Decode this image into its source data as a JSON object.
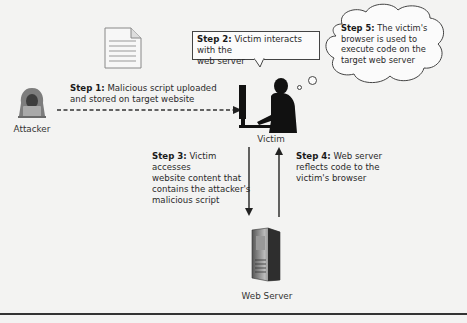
{
  "diagram": {
    "title_hint": "Stored cross-site scripting attack flow",
    "nodes": {
      "attacker": {
        "label": "Attacker",
        "icon": "hooded-hacker-icon"
      },
      "script": {
        "icon": "document-icon"
      },
      "victim": {
        "label": "Victim",
        "icon": "person-at-computer-icon"
      },
      "server": {
        "label": "Web Server",
        "icon": "server-tower-icon"
      }
    },
    "steps": [
      {
        "id": "step1",
        "title": "Step 1:",
        "text": "Malicious script uploaded and stored on target website",
        "line1": "Malicious script uploaded",
        "line2": "and stored on target website"
      },
      {
        "id": "step2",
        "title": "Step 2:",
        "text": "Victim interacts with the web server",
        "line1": "Victim interacts with the",
        "line2": "web server"
      },
      {
        "id": "step3",
        "title": "Step 3:",
        "text": "Victim accesses website content that contains the attacker's malicious script",
        "line1": "Victim accesses",
        "line2": "website content that",
        "line3": "contains the attacker's",
        "line4": "malicious script"
      },
      {
        "id": "step4",
        "title": "Step 4:",
        "text": "Web server reflects code to the victim's browser",
        "line1": "Web server",
        "line2": "reflects code to the",
        "line3": "victim's browser"
      },
      {
        "id": "step5",
        "title": "Step 5:",
        "text": "The victim's browser is used to execute code on the target web server",
        "line1": "The victim's",
        "line2": "browser is used to",
        "line3": "execute code on the",
        "line4": "target web server"
      }
    ],
    "edges": [
      {
        "from": "attacker",
        "to": "victim",
        "style": "dashed",
        "step": "step1"
      },
      {
        "from": "victim",
        "to": "server",
        "style": "solid",
        "step": "step3"
      },
      {
        "from": "server",
        "to": "victim",
        "style": "solid",
        "step": "step4"
      }
    ]
  }
}
